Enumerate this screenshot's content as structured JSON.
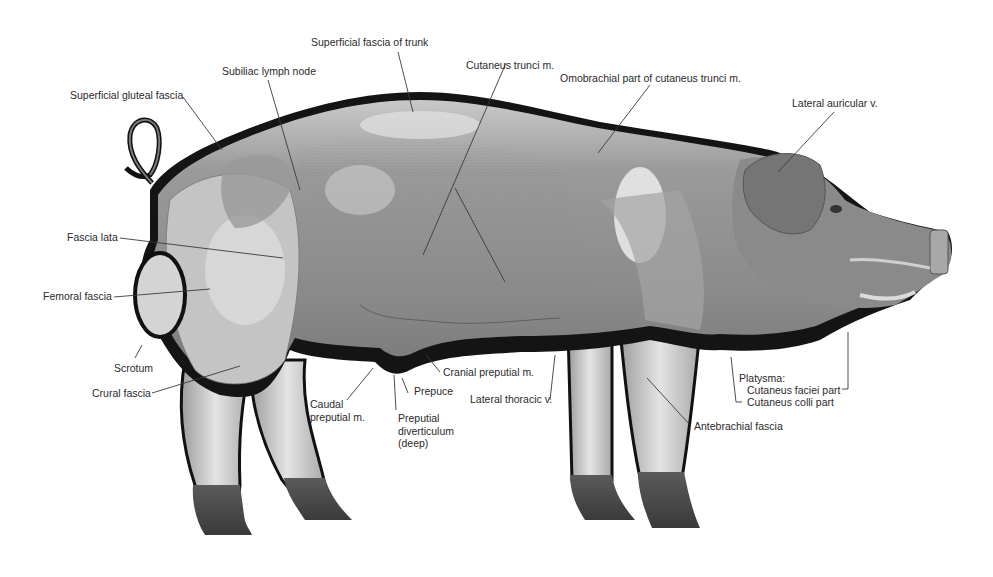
{
  "figure": {
    "colors": {
      "background": "#ffffff",
      "outline": "#111111",
      "body_mid": "#8e8e8e",
      "body_light": "#d6d6d6",
      "body_dark": "#6a6a6a",
      "hoof": "#4a4a4a",
      "leader": "#3a3a3a",
      "label_text": "#2a2a2a"
    }
  },
  "labels": {
    "superficial_fascia_trunk": "Superficial fascia of trunk",
    "subiliac_lymph_node": "Subiliac lymph node",
    "superficial_gluteal_fascia": "Superficial gluteal fascia",
    "cutaneus_trunci": "Cutaneus trunci m.",
    "omobrachial_part": "Omobrachial part of cutaneus trunci m.",
    "lateral_auricular": "Lateral auricular v.",
    "fascia_lata": "Fascia lata",
    "femoral_fascia": "Femoral fascia",
    "scrotum": "Scrotum",
    "crural_fascia": "Crural fascia",
    "caudal_preputial_line1": "Caudal",
    "caudal_preputial_line2": "preputial m.",
    "prepuce": "Prepuce",
    "cranial_preputial": "Cranial preputial m.",
    "preputial_diverticulum_line1": "Preputial",
    "preputial_diverticulum_line2": "diverticulum",
    "preputial_diverticulum_line3": "(deep)",
    "lateral_thoracic": "Lateral thoracic v.",
    "platysma": "Platysma:",
    "cutaneus_faciei": "Cutaneus faciei part",
    "cutaneus_colli": "Cutaneus colli part",
    "antebrachial_fascia": "Antebrachial fascia"
  }
}
